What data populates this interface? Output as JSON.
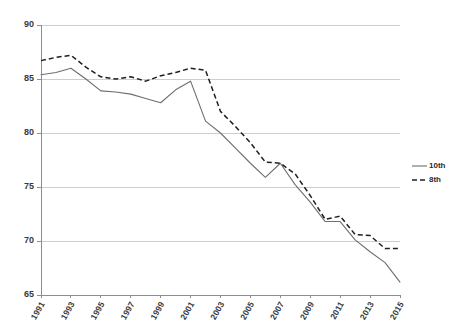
{
  "chart_data": {
    "type": "line",
    "title": "",
    "subtitle": "",
    "xlabel": "",
    "ylabel": "",
    "x": [
      1991,
      1992,
      1993,
      1994,
      1995,
      1996,
      1997,
      1998,
      1999,
      2000,
      2001,
      2002,
      2003,
      2004,
      2005,
      2006,
      2007,
      2008,
      2009,
      2010,
      2011,
      2012,
      2013,
      2014,
      2015
    ],
    "xtick_labels": [
      "1991",
      "1993",
      "1995",
      "1997",
      "1999",
      "2001",
      "2003",
      "2005",
      "2007",
      "2009",
      "2011",
      "2013",
      "2015"
    ],
    "xtick_values": [
      1991,
      1993,
      1995,
      1997,
      1999,
      2001,
      2003,
      2005,
      2007,
      2009,
      2011,
      2013,
      2015
    ],
    "ytick_labels": [
      "65",
      "70",
      "75",
      "80",
      "85",
      "90"
    ],
    "ytick_values": [
      65,
      70,
      75,
      80,
      85,
      90
    ],
    "ylim": [
      65,
      90
    ],
    "xlim": [
      1991,
      2015
    ],
    "grid": "horizontal",
    "legend_position": "right",
    "series": [
      {
        "name": "10th",
        "style": "solid",
        "color": "#6e6e6e",
        "values": [
          85.4,
          85.6,
          86.0,
          85.0,
          83.9,
          83.8,
          83.6,
          83.2,
          82.8,
          84.0,
          84.8,
          81.1,
          80.0,
          78.6,
          77.2,
          75.9,
          77.2,
          75.2,
          73.6,
          71.8,
          71.8,
          70.1,
          69.0,
          68.0,
          66.2
        ]
      },
      {
        "name": "8th",
        "style": "dashed",
        "color": "#1f1f1f",
        "values": [
          86.7,
          87.0,
          87.2,
          86.1,
          85.2,
          85.0,
          85.2,
          84.8,
          85.3,
          85.6,
          86.0,
          85.8,
          82.0,
          80.6,
          79.1,
          77.3,
          77.2,
          76.2,
          74.2,
          72.0,
          72.3,
          70.6,
          70.5,
          69.3,
          69.3
        ]
      }
    ],
    "legend": [
      {
        "label": "10th",
        "style": "solid",
        "color": "#6e6e6e"
      },
      {
        "label": "8th",
        "style": "dashed",
        "color": "#1f1f1f"
      }
    ]
  }
}
